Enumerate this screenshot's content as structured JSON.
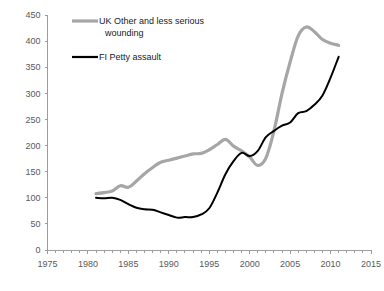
{
  "chart_data": {
    "type": "line",
    "title": "",
    "xlabel": "",
    "ylabel": "",
    "xlim": [
      1975,
      2015
    ],
    "ylim": [
      0,
      450
    ],
    "ytick_step": 50,
    "xtick_step": 5,
    "minor_xtick_step": 1,
    "grid": false,
    "legend_position": "top-left",
    "yticks": [
      "0",
      "50",
      "100",
      "150",
      "200",
      "250",
      "300",
      "350",
      "400",
      "450"
    ],
    "xticks": [
      "1975",
      "1980",
      "1985",
      "1990",
      "1995",
      "2000",
      "2005",
      "2010",
      "2015"
    ],
    "series": [
      {
        "name": "UK Other and less serious wounding",
        "color": "#a6a6a6",
        "width": 3.2,
        "x": [
          1981,
          1982,
          1983,
          1984,
          1985,
          1986,
          1987,
          1988,
          1989,
          1990,
          1991,
          1992,
          1993,
          1994,
          1995,
          1996,
          1997,
          1998,
          1999,
          2000,
          2001,
          2002,
          2003,
          2004,
          2005,
          2006,
          2007,
          2008,
          2009,
          2010,
          2011
        ],
        "values": [
          108,
          110,
          113,
          123,
          120,
          132,
          146,
          158,
          168,
          172,
          176,
          180,
          184,
          185,
          192,
          202,
          212,
          199,
          190,
          178,
          162,
          176,
          228,
          300,
          360,
          410,
          427,
          418,
          403,
          396,
          392
        ]
      },
      {
        "name": "FI Petty assault",
        "color": "#000000",
        "width": 2.0,
        "x": [
          1981,
          1982,
          1983,
          1984,
          1985,
          1986,
          1987,
          1988,
          1989,
          1990,
          1991,
          1992,
          1993,
          1994,
          1995,
          1996,
          1997,
          1998,
          1999,
          2000,
          2001,
          2002,
          2003,
          2004,
          2005,
          2006,
          2007,
          2008,
          2009,
          2010,
          2011
        ],
        "values": [
          100,
          99,
          100,
          96,
          88,
          81,
          78,
          77,
          72,
          67,
          62,
          63,
          63,
          68,
          80,
          110,
          145,
          170,
          186,
          180,
          190,
          216,
          228,
          238,
          244,
          262,
          266,
          278,
          296,
          330,
          370
        ]
      }
    ],
    "legend": [
      {
        "label_line1": "UK Other and less serious",
        "label_line2": "wounding",
        "color": "#a6a6a6"
      },
      {
        "label_line1": "FI Petty assault",
        "label_line2": "",
        "color": "#000000"
      }
    ]
  }
}
